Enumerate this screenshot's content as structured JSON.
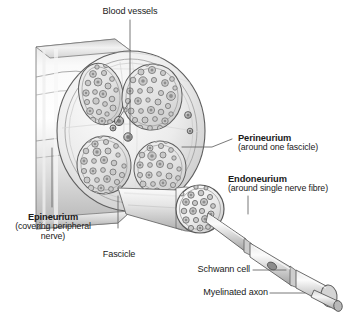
{
  "figure": {
    "background_color": "#ffffff",
    "ink_color": "#1a1a1a",
    "leader_color": "#555555",
    "sheath_light": "#fbfbfb",
    "sheath_mid": "#d8d8d8",
    "sheath_dark": "#9a9a9a",
    "fibre_fill": "#c9c9c9",
    "fibre_stroke": "#6e6e6e",
    "fascicle_fill": "#e8e8e8",
    "vessel_fill": "#b5b5b5"
  },
  "labels": {
    "blood_vessels": {
      "text": "Blood vessels",
      "style": "plain"
    },
    "perineurium": {
      "title": "Perineurium",
      "subtitle": "(around one fascicle)",
      "style": "bold"
    },
    "endoneurium": {
      "title": "Endoneurium",
      "subtitle": "(around single nerve fibre)",
      "style": "bold"
    },
    "epineurium": {
      "title": "Epineurium",
      "subtitle_line1": "(covering peripheral",
      "subtitle_line2": "nerve)",
      "style": "bold"
    },
    "fascicle": {
      "text": "Fascicle",
      "style": "plain"
    },
    "schwann_cell": {
      "text": "Schwann cell",
      "style": "plain"
    },
    "myelinated_axon": {
      "text": "Myelinated axon",
      "style": "plain"
    }
  },
  "anatomy": {
    "fascicle_count": 4,
    "fascicles": [
      {
        "name": "fascicle-upper-left",
        "cx": 101,
        "cy": 94,
        "rx": 22,
        "ry": 31,
        "rot": -12,
        "fibre_count": 26
      },
      {
        "name": "fascicle-upper-right",
        "cx": 152,
        "cy": 97,
        "rx": 30,
        "ry": 33,
        "rot": 8,
        "fibre_count": 34
      },
      {
        "name": "fascicle-lower-left",
        "cx": 104,
        "cy": 165,
        "rx": 27,
        "ry": 29,
        "rot": -6,
        "fibre_count": 30
      },
      {
        "name": "fascicle-lower-right",
        "cx": 160,
        "cy": 168,
        "rx": 26,
        "ry": 27,
        "rot": 6,
        "fibre_count": 28
      }
    ],
    "blood_vessels": [
      {
        "name": "vessel-central-upper",
        "cx": 119,
        "cy": 121,
        "r": 4.6
      },
      {
        "name": "vessel-central-lower",
        "cx": 128,
        "cy": 137,
        "r": 4.2
      },
      {
        "name": "vessel-left-small",
        "cx": 113,
        "cy": 127,
        "r": 3.0
      },
      {
        "name": "vessel-edge-upper",
        "cx": 188,
        "cy": 115,
        "r": 3.4
      },
      {
        "name": "vessel-edge-lower",
        "cx": 190,
        "cy": 131,
        "r": 2.8
      }
    ],
    "magnified_fascicle": {
      "cx": 200,
      "cy": 209,
      "r": 24,
      "fibre_count": 21
    },
    "myelinated_axon_segments": 3
  }
}
